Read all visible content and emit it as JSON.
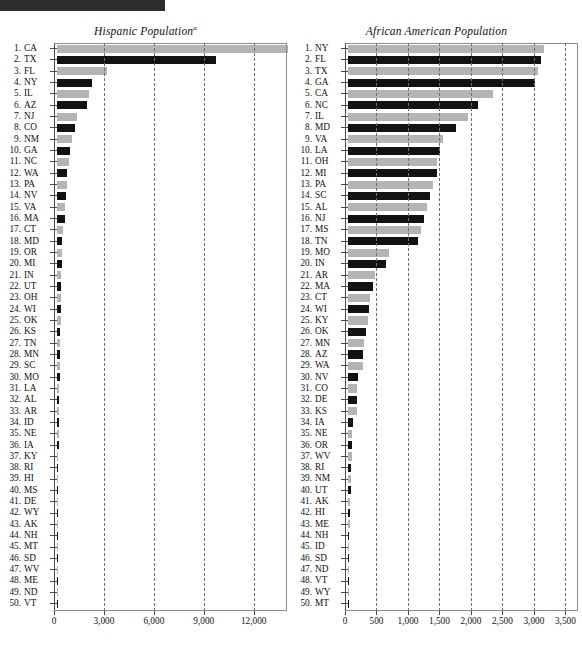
{
  "page": {
    "header_bar_color": "#2e2e2e",
    "bar_gray": "#b4b4b4",
    "bar_black": "#121212"
  },
  "chart_data": [
    {
      "type": "bar",
      "orientation": "horizontal",
      "title": "Hispanic Population",
      "title_superscript": "a",
      "xlabel": "",
      "ylabel": "",
      "xlim": [
        0,
        14000
      ],
      "grid": true,
      "grid_style": "dashed",
      "legend": "none",
      "tick_values": [
        0,
        3000,
        6000,
        9000,
        12000
      ],
      "tick_labels": [
        "0",
        "3,000",
        "6,000",
        "9,000",
        "12,000"
      ],
      "categories": [
        "CA",
        "TX",
        "FL",
        "NY",
        "IL",
        "AZ",
        "NJ",
        "CO",
        "NM",
        "GA",
        "NC",
        "WA",
        "PA",
        "NV",
        "VA",
        "MA",
        "CT",
        "MD",
        "OR",
        "MI",
        "IN",
        "UT",
        "OH",
        "WI",
        "OK",
        "KS",
        "TN",
        "MN",
        "SC",
        "MO",
        "LA",
        "AL",
        "AR",
        "ID",
        "NE",
        "IA",
        "KY",
        "RI",
        "HI",
        "MS",
        "DE",
        "WY",
        "AK",
        "NH",
        "MT",
        "SD",
        "WV",
        "ME",
        "ND",
        "VT"
      ],
      "ranks": [
        1,
        2,
        3,
        4,
        5,
        6,
        7,
        8,
        9,
        10,
        11,
        12,
        13,
        14,
        15,
        16,
        17,
        18,
        19,
        20,
        21,
        22,
        23,
        24,
        25,
        26,
        27,
        28,
        29,
        30,
        31,
        32,
        33,
        34,
        35,
        36,
        37,
        38,
        39,
        40,
        41,
        42,
        43,
        44,
        45,
        46,
        47,
        48,
        49,
        50
      ],
      "values": [
        13800,
        9500,
        3000,
        2100,
        1900,
        1800,
        1200,
        1100,
        900,
        800,
        700,
        600,
        580,
        550,
        500,
        470,
        330,
        280,
        275,
        270,
        250,
        245,
        240,
        230,
        215,
        205,
        200,
        190,
        180,
        170,
        130,
        120,
        110,
        100,
        95,
        90,
        85,
        80,
        75,
        72,
        70,
        65,
        62,
        60,
        55,
        50,
        45,
        42,
        38,
        35
      ]
    },
    {
      "type": "bar",
      "orientation": "horizontal",
      "title": "African American Population",
      "title_superscript": "",
      "xlabel": "",
      "ylabel": "",
      "xlim": [
        0,
        3700
      ],
      "grid": true,
      "grid_style": "dashed",
      "legend": "none",
      "tick_values": [
        0,
        500,
        1000,
        1500,
        2000,
        2500,
        3000,
        3500
      ],
      "tick_labels": [
        "0",
        "500",
        "1,000",
        "1,500",
        "2,000",
        "2,500",
        "3,000",
        "3,500"
      ],
      "categories": [
        "NY",
        "FL",
        "TX",
        "GA",
        "CA",
        "NC",
        "IL",
        "MD",
        "VA",
        "LA",
        "OH",
        "MI",
        "PA",
        "SC",
        "AL",
        "NJ",
        "MS",
        "TN",
        "MO",
        "IN",
        "AR",
        "MA",
        "CT",
        "WI",
        "KY",
        "OK",
        "MN",
        "AZ",
        "WA",
        "NV",
        "CO",
        "DE",
        "KS",
        "IA",
        "NE",
        "OR",
        "WV",
        "RI",
        "NM",
        "UT",
        "AK",
        "HI",
        "ME",
        "NH",
        "ID",
        "SD",
        "ND",
        "VT",
        "WY",
        "MT"
      ],
      "ranks": [
        1,
        2,
        3,
        4,
        5,
        6,
        7,
        8,
        9,
        10,
        11,
        12,
        13,
        14,
        15,
        16,
        17,
        18,
        19,
        20,
        21,
        22,
        23,
        24,
        25,
        26,
        27,
        28,
        29,
        30,
        31,
        32,
        33,
        34,
        35,
        36,
        37,
        38,
        39,
        40,
        41,
        42,
        43,
        44,
        45,
        46,
        47,
        48,
        49,
        50
      ],
      "values": [
        3100,
        3050,
        3000,
        2950,
        2300,
        2050,
        1900,
        1700,
        1500,
        1450,
        1400,
        1400,
        1350,
        1300,
        1250,
        1200,
        1150,
        1100,
        650,
        600,
        420,
        400,
        350,
        330,
        320,
        280,
        250,
        240,
        230,
        160,
        150,
        150,
        140,
        80,
        70,
        65,
        60,
        55,
        45,
        40,
        35,
        30,
        25,
        20,
        18,
        15,
        12,
        10,
        8,
        5
      ]
    }
  ]
}
